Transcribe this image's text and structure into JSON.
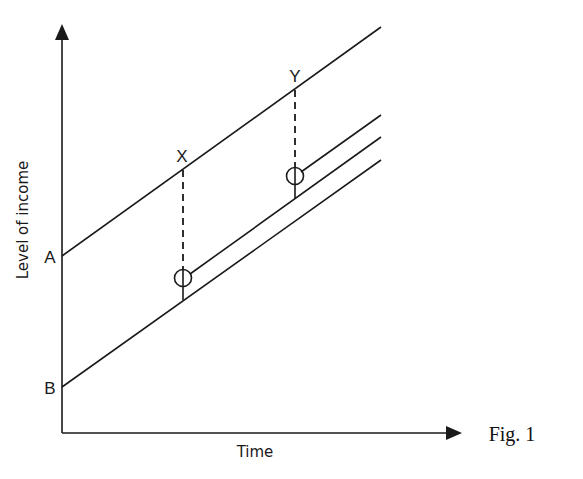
{
  "figure": {
    "caption": "Fig. 1",
    "y_axis_label": "Level of income",
    "x_axis_label": "Time",
    "intercept_labels": {
      "upper": "A",
      "lower": "B"
    },
    "point_labels": {
      "first": "X",
      "second": "Y"
    }
  },
  "diagram": {
    "type": "income-path",
    "lines": [
      {
        "name": "A-path",
        "from": [
          62,
          256
        ],
        "to": [
          381,
          27
        ]
      },
      {
        "name": "B-path",
        "from": [
          62,
          387
        ],
        "to": [
          381,
          160
        ]
      },
      {
        "name": "path-after-X",
        "from": [
          190,
          274
        ],
        "to": [
          381,
          137
        ]
      },
      {
        "name": "path-after-Y",
        "from": [
          301,
          172
        ],
        "to": [
          381,
          115
        ]
      }
    ],
    "markers": [
      {
        "label": "X",
        "top": [
          183,
          168
        ],
        "circle": [
          183,
          278
        ],
        "base": [
          183,
          300
        ]
      },
      {
        "label": "Y",
        "top": [
          295,
          88
        ],
        "circle": [
          295,
          176
        ],
        "base": [
          295,
          198
        ]
      }
    ],
    "stroke_color": "#1a1a1a"
  }
}
